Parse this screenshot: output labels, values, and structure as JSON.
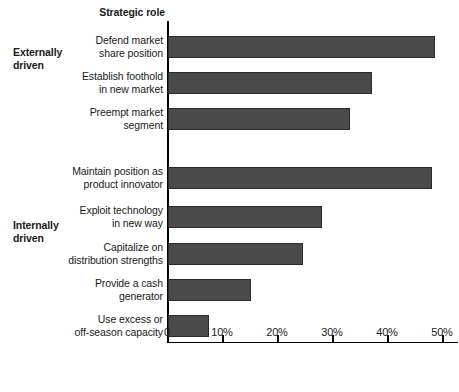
{
  "axis_title": "Strategic role",
  "groups": [
    {
      "name": "group-external",
      "label": "Externally\ndriven"
    },
    {
      "name": "group-internal",
      "label": "Internally\ndriven"
    }
  ],
  "colors": {
    "bar_fill": "#4a4a4a",
    "bar_border": "#2b2b2b",
    "axis": "#000000",
    "background": "#ffffff",
    "text": "#1a1a1a"
  },
  "chart_data": {
    "type": "bar",
    "orientation": "horizontal",
    "title": "",
    "subtitle": "",
    "xlabel": "",
    "ylabel": "Strategic role",
    "xlim": [
      0,
      53
    ],
    "grid": false,
    "legend": "none",
    "tick_labels": [
      "0",
      "10%",
      "20%",
      "30%",
      "40%",
      "50%"
    ],
    "tick_values": [
      0,
      10,
      20,
      30,
      40,
      50
    ],
    "categories": [
      "Defend market\nshare position",
      "Establish foothold\nin new market",
      "Preempt market\nsegment",
      "Maintain position as\nproduct innovator",
      "Exploit technology\nin new way",
      "Capitalize on\ndistribution strengths",
      "Provide a cash\ngenerator",
      "Use excess or\noff-season capacity"
    ],
    "values": [
      48.5,
      37,
      33,
      48,
      28,
      24.5,
      15,
      7.5
    ],
    "group_assignment": [
      "Externally driven",
      "Externally driven",
      "Externally driven",
      "Internally driven",
      "Internally driven",
      "Internally driven",
      "Internally driven",
      "Internally driven"
    ]
  }
}
